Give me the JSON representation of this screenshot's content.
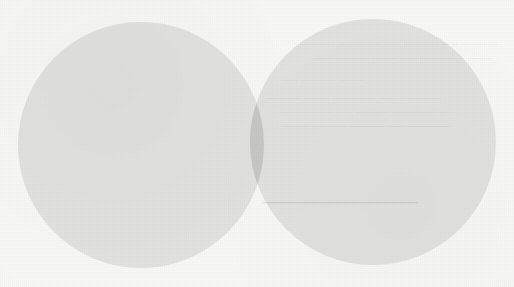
{
  "document": {
    "kind": "scanned-page",
    "media": "printed paper",
    "background_color": "#f8f8f7",
    "width": 514,
    "height": 287,
    "visible_labels": [],
    "notes_text": ""
  },
  "diagram": {
    "type": "venn",
    "set_count": 2,
    "fill_color": "#e2e2e1",
    "overlap_color": "#cfcfce",
    "outline": "none",
    "labels_visible": false,
    "sets": [
      {
        "id": "left",
        "name": "left-circle",
        "label": "",
        "center_x": 141,
        "center_y": 145,
        "radius": 123
      },
      {
        "id": "right",
        "name": "right-circle",
        "label": "",
        "center_x": 373,
        "center_y": 142,
        "radius": 123
      }
    ],
    "intersection": {
      "name": "overlap-region",
      "label": "",
      "x_start": 190,
      "x_end": 265,
      "y_start": 60,
      "y_end": 230
    }
  },
  "showthrough": {
    "description": "faint mirrored ink bleed from reverse side of the page",
    "legible": false,
    "color": "#585c60",
    "lines": [
      {
        "id": "a",
        "text": "— ——— —— ———— —— ————— ————"
      },
      {
        "id": "b",
        "text": "——— ————— —— ——— ———— ——"
      },
      {
        "id": "c",
        "text": "———— ——— ————— ——— ————"
      },
      {
        "id": "d",
        "text": "—— ————— ———— —— ——————"
      },
      {
        "id": "e",
        "text": "————— —— ———— ———— ———"
      },
      {
        "id": "f",
        "text": "——— ———— ——"
      }
    ],
    "heading_word": "————————"
  }
}
